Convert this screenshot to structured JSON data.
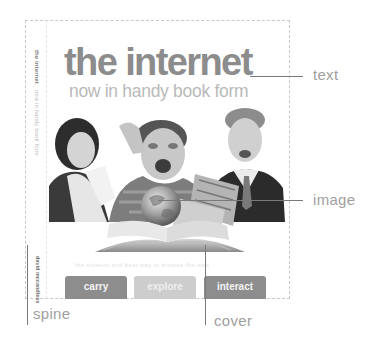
{
  "book_cover": {
    "title": "the internet",
    "subtitle": "now in handy book form",
    "tagline": "the slowest and best way to browse the web",
    "buttons": [
      {
        "label": "carry",
        "color": "#8d8d8d"
      },
      {
        "label": "explore",
        "color": "#cdcdcd"
      },
      {
        "label": "interact",
        "color": "#8d8d8d"
      }
    ],
    "image_description": "three excited people looking at an open book with a globe rising out of it"
  },
  "spine": {
    "title": "the internet",
    "subtitle": "now in handy book form",
    "author": "david mccandless"
  },
  "callouts": {
    "text": "text",
    "image": "image",
    "spine": "spine",
    "cover": "cover"
  },
  "colors": {
    "title": "#8c8c8c",
    "subtitle": "#b9b9b9",
    "callout_line": "#7a7a7a",
    "callout_label": "#a0a0a0",
    "outline": "#c8c8c8"
  }
}
